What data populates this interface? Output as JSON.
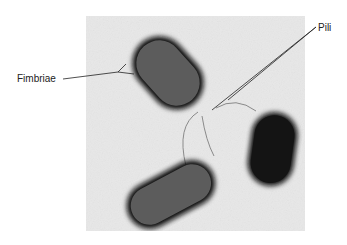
{
  "figure": {
    "labels": [
      {
        "id": "fimbriae",
        "text": "Fimbriae"
      },
      {
        "id": "pili",
        "text": "Pili"
      }
    ],
    "colors": {
      "background": "#e6e6e6",
      "cell_body": "#5a5a5a",
      "cell_halo": "#1a1a1a",
      "dark_cell": "#111111",
      "leader_line": "#222222"
    }
  }
}
